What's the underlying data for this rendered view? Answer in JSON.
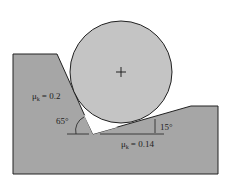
{
  "diagram": {
    "left_surface": {
      "mu_symbol": "μ",
      "mu_sub": "k",
      "mu_value": "= 0.2",
      "angle": "65°"
    },
    "right_surface": {
      "mu_symbol": "μ",
      "mu_sub": "k",
      "mu_value": "= 0.14",
      "angle": "15°"
    },
    "cylinder": {
      "center_mark": "+"
    },
    "colors": {
      "ground": "#a6a6a6",
      "cylinder": "#c4c4c4",
      "stroke": "#222222",
      "background": "#ffffff"
    }
  }
}
